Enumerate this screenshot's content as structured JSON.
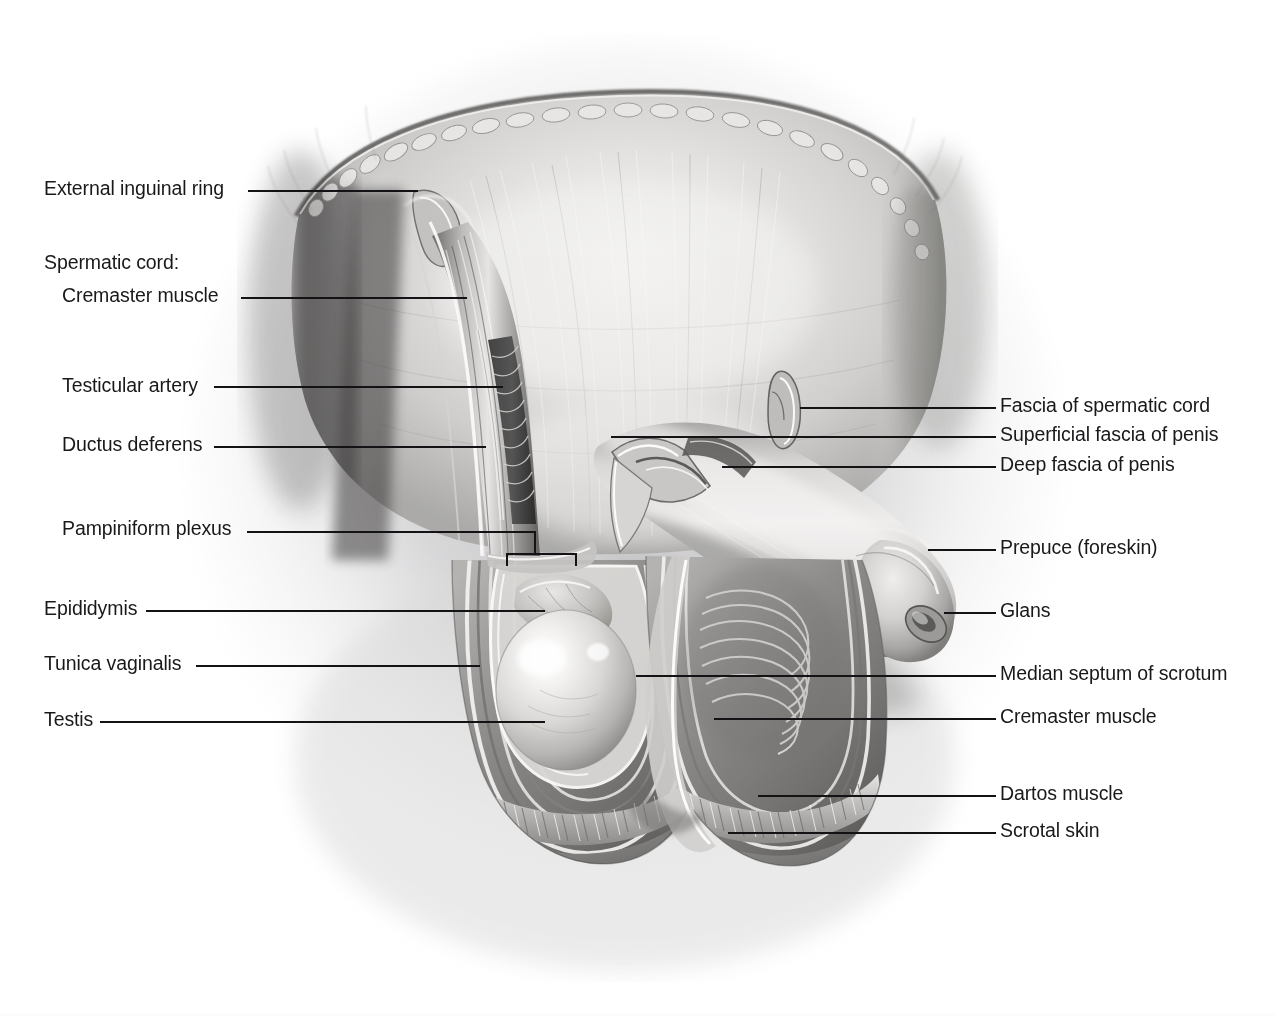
{
  "figure": {
    "orientation": "anterior view",
    "background_color": "#ffffff",
    "text_color": "#19191c",
    "leader_color": "#131316",
    "style": "grayscale pencil / airbrush medical illustration"
  },
  "labels_left": [
    {
      "text": "External inguinal ring",
      "x": 44,
      "y": 178,
      "leader_x1": 248,
      "leader_x2": 418,
      "leader_y": 190,
      "indent": false
    },
    {
      "text": "Spermatic cord:",
      "x": 44,
      "y": 252,
      "leader_x1": 0,
      "leader_x2": 0,
      "leader_y": 0,
      "indent": false
    },
    {
      "text": "Cremaster muscle",
      "x": 62,
      "y": 285,
      "leader_x1": 241,
      "leader_x2": 467,
      "leader_y": 297,
      "indent": true
    },
    {
      "text": "Testicular artery",
      "x": 62,
      "y": 375,
      "leader_x1": 214,
      "leader_x2": 503,
      "leader_y": 386,
      "indent": true
    },
    {
      "text": "Ductus deferens",
      "x": 62,
      "y": 434,
      "leader_x1": 214,
      "leader_x2": 486,
      "leader_y": 446,
      "indent": true
    },
    {
      "text": "Pampiniform plexus",
      "x": 62,
      "y": 518,
      "leader_x1": 247,
      "leader_x2": 534,
      "leader_y": 531,
      "indent": true
    },
    {
      "text": "Epididymis",
      "x": 44,
      "y": 598,
      "leader_x1": 146,
      "leader_x2": 545,
      "leader_y": 610,
      "indent": false
    },
    {
      "text": "Tunica vaginalis",
      "x": 44,
      "y": 653,
      "leader_x1": 196,
      "leader_x2": 480,
      "leader_y": 665,
      "indent": false
    },
    {
      "text": "Testis",
      "x": 44,
      "y": 709,
      "leader_x1": 100,
      "leader_x2": 545,
      "leader_y": 721,
      "indent": false
    }
  ],
  "labels_right": [
    {
      "text": "Fascia of spermatic cord",
      "x": 1000,
      "y": 395,
      "leader_x1": 800,
      "leader_x2": 996,
      "leader_y": 407
    },
    {
      "text": "Superficial fascia of penis",
      "x": 1000,
      "y": 424,
      "leader_x1": 611,
      "leader_x2": 996,
      "leader_y": 436
    },
    {
      "text": "Deep fascia of penis",
      "x": 1000,
      "y": 454,
      "leader_x1": 722,
      "leader_x2": 996,
      "leader_y": 466
    },
    {
      "text": "Prepuce (foreskin)",
      "x": 1000,
      "y": 537,
      "leader_x1": 928,
      "leader_x2": 996,
      "leader_y": 549
    },
    {
      "text": "Glans",
      "x": 1000,
      "y": 600,
      "leader_x1": 944,
      "leader_x2": 996,
      "leader_y": 612
    },
    {
      "text": "Median septum of scrotum",
      "x": 1000,
      "y": 663,
      "leader_x1": 636,
      "leader_x2": 996,
      "leader_y": 675
    },
    {
      "text": "Cremaster muscle",
      "x": 1000,
      "y": 706,
      "leader_x1": 714,
      "leader_x2": 996,
      "leader_y": 718
    },
    {
      "text": "Dartos muscle",
      "x": 1000,
      "y": 783,
      "leader_x1": 758,
      "leader_x2": 996,
      "leader_y": 795
    },
    {
      "text": "Scrotal skin",
      "x": 1000,
      "y": 820,
      "leader_x1": 728,
      "leader_x2": 996,
      "leader_y": 832
    }
  ],
  "bracket": {
    "name": "pampiniform-plexus-bracket",
    "x1": 504,
    "x2": 534,
    "y_top": 531,
    "y_bottom": 553,
    "inner_x1": 506,
    "inner_x2": 575,
    "inner_y": 553
  },
  "artwork_regions": [
    {
      "name": "abdominal-wall-aponeurosis",
      "description": "fan-shaped pubic / inguinal region with cut skin edge and fat lobules along the superior border"
    },
    {
      "name": "external-inguinal-ring",
      "description": "triangular slit opening in the aponeurosis on the left side"
    },
    {
      "name": "spermatic-cord",
      "description": "vertical cord descending from inguinal ring with cremaster fibers, artery, ductus deferens and pampiniform veins"
    },
    {
      "name": "penis-shaft",
      "description": "shaft crossing to the upper right with cut-away cuff of superficial and deep fascia"
    },
    {
      "name": "glans-and-prepuce",
      "description": "rounded distal end with retracted foreskin rim"
    },
    {
      "name": "left-scrotal-compartment",
      "description": "opened sac exposing testis, epididymis and layered tunica vaginalis"
    },
    {
      "name": "right-scrotal-compartment",
      "description": "opened sac showing cremaster muscle fibers over the septum"
    },
    {
      "name": "median-septum",
      "description": "midline partition between the two scrotal sacs"
    },
    {
      "name": "dartos-and-skin-layers",
      "description": "banded dartos muscle layer and outer scrotal skin along the inferior cut margin"
    }
  ]
}
